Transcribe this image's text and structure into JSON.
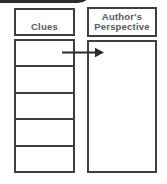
{
  "diagram": {
    "clues_column": {
      "header": "Clues",
      "cells": [
        "",
        "",
        "",
        "",
        ""
      ]
    },
    "perspective_column": {
      "header_line1": "Author's",
      "header_line2": "Perspective"
    },
    "arrow": {
      "direction": "right",
      "from": "clues-column",
      "to": "perspective-column"
    },
    "colors": {
      "background": "#ffffff",
      "border": "#3f3f40",
      "header_text": "#58595b",
      "arrow": "#2b2b2b",
      "top_tab": "#2b2b2b"
    }
  }
}
